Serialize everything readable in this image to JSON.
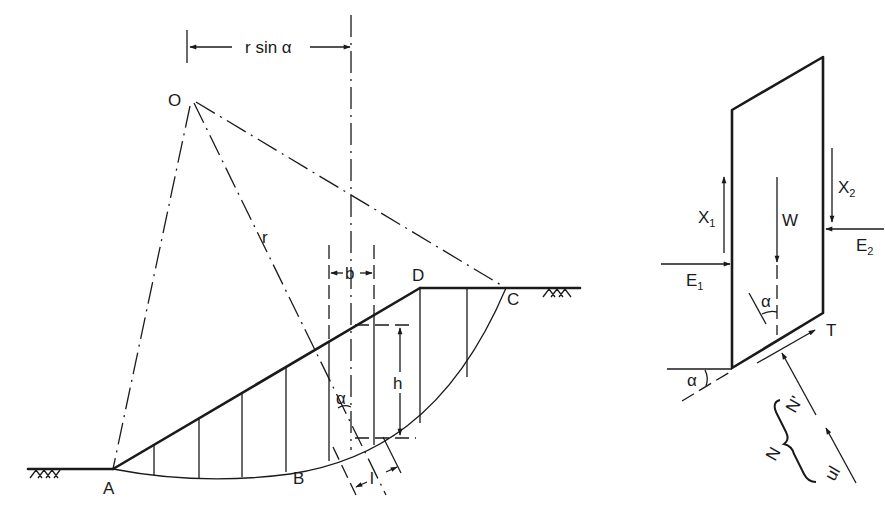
{
  "figure": {
    "colors": {
      "ink": "#1a1a1a",
      "background": "#ffffff"
    }
  },
  "slope_diagram": {
    "labels": {
      "centre": "O",
      "radius": "r",
      "toe": "A",
      "base_point": "B",
      "crest_exit": "C",
      "crest": "D",
      "moment_arm": "r sin α",
      "slice_width": "b",
      "slice_height": "h",
      "base_length": "l",
      "base_angle": "α"
    },
    "ground_symbol": "hatch",
    "slice_count": 9
  },
  "slice_fbd": {
    "labels": {
      "weight": "W",
      "shear_left": "X",
      "shear_left_sub": "1",
      "shear_right": "X",
      "shear_right_sub": "2",
      "normal_left": "E",
      "normal_left_sub": "1",
      "normal_right": "E",
      "normal_right_sub": "2",
      "shear_base": "T",
      "effective_normal": "N'",
      "total_normal": "N",
      "pore_force": "ul",
      "angle_top": "α",
      "angle_base": "α"
    }
  }
}
